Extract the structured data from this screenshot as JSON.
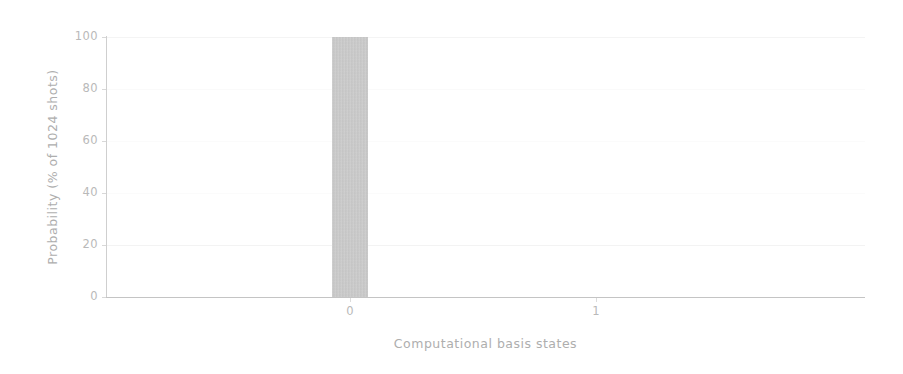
{
  "chart_data": {
    "type": "bar",
    "title": "",
    "subtitle": "",
    "xlabel": "Computational basis states",
    "ylabel": "Probability (% of 1024 shots)",
    "categories": [
      "0",
      "1"
    ],
    "values": [
      100,
      0
    ],
    "series": [
      {
        "name": "Probability",
        "values": [
          100,
          0
        ]
      }
    ],
    "ylim": [
      0,
      100
    ],
    "yticks": [
      0,
      20,
      40,
      60,
      80,
      100
    ],
    "ytick_labels": [
      "0",
      "20",
      "40",
      "60",
      "80",
      "100"
    ],
    "xticks": [
      0,
      1
    ],
    "xtick_labels": [
      "0",
      "1"
    ],
    "grid": true,
    "grid_axis": "y",
    "legend": false,
    "legend_position": "none",
    "bar_color": "#c9c9c9",
    "axis_color": "#c7c7c7",
    "text_color": "#b4b4b4",
    "background_color": "#ffffff",
    "total_shots": 1024,
    "annotations": []
  }
}
